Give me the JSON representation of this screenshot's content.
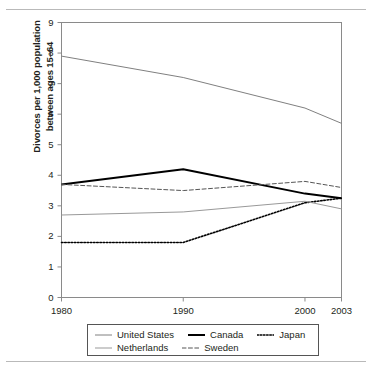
{
  "chart_data": {
    "type": "line",
    "title": "",
    "xlabel": "",
    "ylabel": "Divorces per 1,000 population between ages 15–64",
    "ylabel_lines": [
      "Divorces per 1,000 population",
      "between ages 15–64"
    ],
    "xlim": [
      1980,
      2003
    ],
    "ylim": [
      0,
      9
    ],
    "grid": false,
    "legend_position": "bottom",
    "x_ticks": [
      1980,
      1990,
      2000,
      2003
    ],
    "x_tick_labels": [
      "1980",
      "1990",
      "2000",
      "2003"
    ],
    "y_ticks": [
      0,
      1,
      2,
      3,
      4,
      5,
      6,
      7,
      8,
      9
    ],
    "y_tick_labels": [
      "0",
      "1",
      "2",
      "3",
      "4",
      "5",
      "6",
      "7",
      "8",
      "9"
    ],
    "x": [
      1980,
      1990,
      2000,
      2003
    ],
    "series": [
      {
        "name": "United States",
        "values": [
          7.9,
          7.2,
          6.2,
          5.7
        ],
        "color": "#808080",
        "style": "solid",
        "width": 1.0
      },
      {
        "name": "Canada",
        "values": [
          3.7,
          4.2,
          3.4,
          3.25
        ],
        "color": "#000000",
        "style": "solid",
        "width": 2.0
      },
      {
        "name": "Japan",
        "values": [
          1.8,
          1.8,
          3.1,
          3.25
        ],
        "color": "#000000",
        "style": "dotted",
        "width": 1.6
      },
      {
        "name": "Netherlands",
        "values": [
          2.7,
          2.8,
          3.15,
          2.9
        ],
        "color": "#999999",
        "style": "solid",
        "width": 1.0
      },
      {
        "name": "Sweden",
        "values": [
          3.7,
          3.5,
          3.8,
          3.6
        ],
        "color": "#555555",
        "style": "dashed",
        "width": 1.0
      }
    ]
  },
  "legend": {
    "rows": [
      [
        {
          "label": "United States",
          "key": "United States"
        },
        {
          "label": "Canada",
          "key": "Canada"
        },
        {
          "label": "Japan",
          "key": "Japan"
        }
      ],
      [
        {
          "label": "Netherlands",
          "key": "Netherlands"
        },
        {
          "label": "Sweden",
          "key": "Sweden"
        }
      ]
    ]
  },
  "colors": {
    "axis": "#8a8a8a",
    "frame": "#8a8a8a",
    "text": "#231f20",
    "rule": "#b9b9b9",
    "legend_border": "#555555",
    "background": "#ffffff"
  }
}
